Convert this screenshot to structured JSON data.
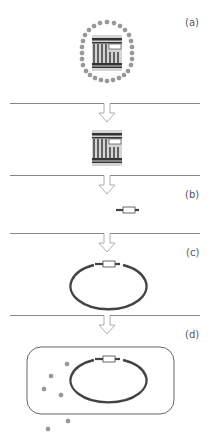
{
  "diagram": {
    "type": "flow",
    "colors": {
      "line": "#888888",
      "dark": "#444444",
      "gray_fill": "#cccccc",
      "bead": "#888888",
      "arrow_stroke": "#999999"
    },
    "panels": [
      {
        "id": "a",
        "label": "(a)",
        "content": "encapsulated-dna-particle"
      },
      {
        "id": "b",
        "label": "(b)",
        "content": "gene-fragment"
      },
      {
        "id": "c",
        "label": "(c)",
        "content": "recombinant-plasmid"
      },
      {
        "id": "d",
        "label": "(d)",
        "content": "cell-with-plasmid"
      }
    ],
    "steps": [
      {
        "from": "a",
        "to": "extracted-dna",
        "arrow": "down"
      },
      {
        "from": "extracted-dna",
        "to": "b",
        "arrow": "down"
      },
      {
        "from": "b",
        "to": "c",
        "arrow": "down"
      },
      {
        "from": "c",
        "to": "d",
        "arrow": "down"
      }
    ]
  }
}
